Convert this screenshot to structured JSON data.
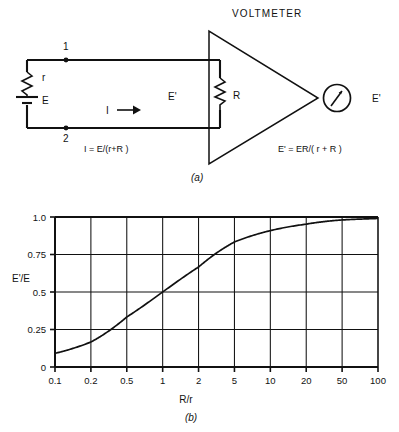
{
  "figure": {
    "panel_a": {
      "title": "VOLTMETER",
      "caption": "(a)",
      "node_top": "1",
      "node_bottom": "2",
      "resistor_internal": "r",
      "source": "E",
      "current": "I",
      "load_voltage": "E'",
      "load_resistor": "R",
      "meter_label": "E'",
      "formula_left": "I = E/(r+R )",
      "formula_right": "E' = ER/( r + R )",
      "icons": {
        "resistor": "resistor-zigzag-icon",
        "battery": "battery-cell-icon",
        "arrow": "current-arrow-icon",
        "meter": "meter-needle-icon",
        "amplifier": "triangle-amplifier-icon"
      }
    },
    "panel_b": {
      "caption": "(b)"
    }
  },
  "chart_data": {
    "type": "line",
    "title": "",
    "xlabel": "R/r",
    "ylabel": "E'/E",
    "xscale": "log-categorical",
    "grid": true,
    "legend": "none",
    "xticks": [
      "0.1",
      "0.2",
      "0.5",
      "1",
      "2",
      "5",
      "10",
      "20",
      "50",
      "100"
    ],
    "xtick_values": [
      0.1,
      0.2,
      0.5,
      1,
      2,
      5,
      10,
      20,
      50,
      100
    ],
    "yticks": [
      "0",
      "0.25",
      "0.5",
      "0.75",
      "1.0"
    ],
    "ytick_values": [
      0,
      0.25,
      0.5,
      0.75,
      1.0
    ],
    "ylim": [
      0,
      1.0
    ],
    "series": [
      {
        "name": "E'/E = R/(r+R)",
        "x": [
          0.1,
          0.2,
          0.5,
          1,
          2,
          5,
          10,
          20,
          50,
          100
        ],
        "values": [
          0.091,
          0.167,
          0.333,
          0.5,
          0.667,
          0.833,
          0.909,
          0.952,
          0.98,
          0.99
        ]
      }
    ]
  }
}
